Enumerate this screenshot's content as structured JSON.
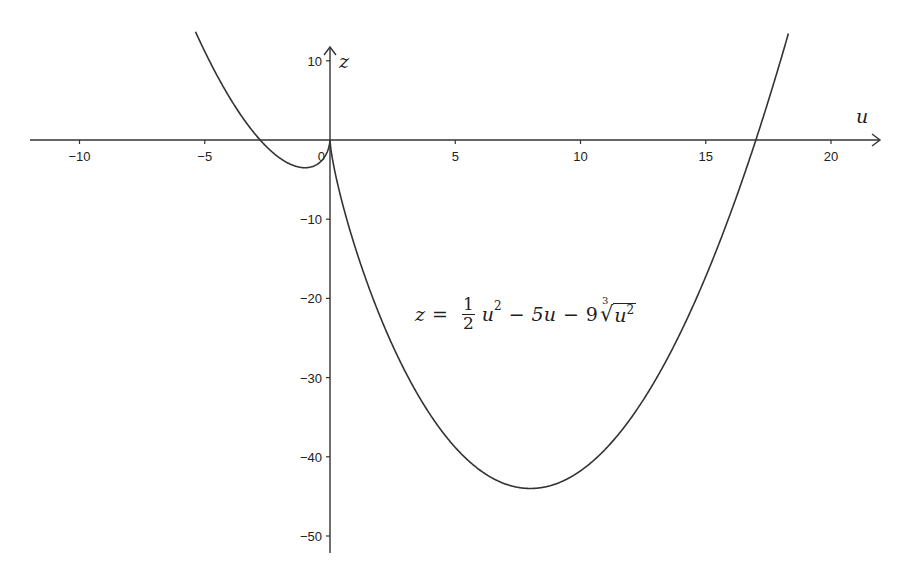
{
  "chart_data": {
    "type": "line",
    "title": "",
    "xlabel": "u",
    "ylabel": "z",
    "xlim": [
      -12,
      22
    ],
    "ylim": [
      -52,
      12
    ],
    "grid": false,
    "legend": null,
    "x_ticks": [
      -10,
      -5,
      0,
      5,
      10,
      15,
      20
    ],
    "x_tick_labels": [
      "-10",
      "-5",
      "0",
      "5",
      "10",
      "15",
      "20"
    ],
    "y_ticks": [
      10,
      -10,
      -20,
      -30,
      -40,
      -50
    ],
    "y_tick_labels": [
      "10",
      "-10",
      "-20",
      "-30",
      "-40",
      "-50"
    ],
    "series": [
      {
        "name": "z = 1/2 u^2 - 5u - 9 cbrt(u^2)",
        "function": "0.5*u^2 - 5*u - 9*cbrt(u^2)",
        "domain": [
          -5.37,
          18.3
        ],
        "key_points": [
          {
            "u": -5.37,
            "z": 13.7,
            "note": "curve exits top-left"
          },
          {
            "u": -2.6,
            "z": 0,
            "note": "negative root"
          },
          {
            "u": -0.9,
            "z": -3.5,
            "note": "local minimum left of origin"
          },
          {
            "u": 0,
            "z": 0,
            "note": "cusp at origin"
          },
          {
            "u": 8,
            "z": -44,
            "note": "global minimum"
          },
          {
            "u": 16.8,
            "z": 0,
            "note": "positive root"
          },
          {
            "u": 18.3,
            "z": 13.4,
            "note": "curve exits top-right"
          }
        ],
        "color": "#333333"
      }
    ],
    "annotations": [
      {
        "text": "z = 1/2 u^2 - 5u - 9 cbrt(u^2)",
        "u": 11,
        "z": -20
      }
    ]
  },
  "formula": {
    "lhs": "z",
    "eq": "=",
    "frac_num": "1",
    "frac_den": "2",
    "term1_var": "u",
    "term1_exp": "2",
    "minus1": "−",
    "term2": "5u",
    "minus2": "−",
    "coef3": "9",
    "root_index": "3",
    "root_sign": "√",
    "radicand_var": "u",
    "radicand_exp": "2"
  },
  "axes": {
    "x_var": "u",
    "z_var": "z",
    "origin_label": "0"
  },
  "colors": {
    "axis": "#333333",
    "curve": "#3a3a3a",
    "text": "#222222",
    "background": "#ffffff"
  }
}
